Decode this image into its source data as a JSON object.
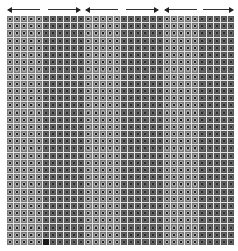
{
  "figure": {
    "arrows": [
      {
        "direction": "left",
        "x_start": 8,
        "x_end": 40
      },
      {
        "direction": "right",
        "x_start": 48,
        "x_end": 80
      },
      {
        "direction": "left",
        "x_start": 86,
        "x_end": 118
      },
      {
        "direction": "right",
        "x_start": 126,
        "x_end": 158
      },
      {
        "direction": "left",
        "x_start": 165,
        "x_end": 197
      },
      {
        "direction": "right",
        "x_start": 203,
        "x_end": 233
      }
    ],
    "grid": {
      "rows": 32,
      "cols": 32,
      "bands": [
        {
          "start_col": 0,
          "end_col": 5,
          "shade": "light"
        },
        {
          "start_col": 5,
          "end_col": 11,
          "shade": "dark"
        },
        {
          "start_col": 11,
          "end_col": 16,
          "shade": "light"
        },
        {
          "start_col": 16,
          "end_col": 22,
          "shade": "dark"
        },
        {
          "start_col": 22,
          "end_col": 27,
          "shade": "light"
        },
        {
          "start_col": 27,
          "end_col": 32,
          "shade": "dark"
        }
      ],
      "filled_cells": [
        {
          "row": 31,
          "col": 5
        }
      ]
    },
    "colors": {
      "gridline": "#e4e4e4",
      "light_cell": "#7a7a7a",
      "dark_cell": "#585858",
      "filled_cell": "#1a1a1a",
      "arrow": "#222222"
    }
  }
}
